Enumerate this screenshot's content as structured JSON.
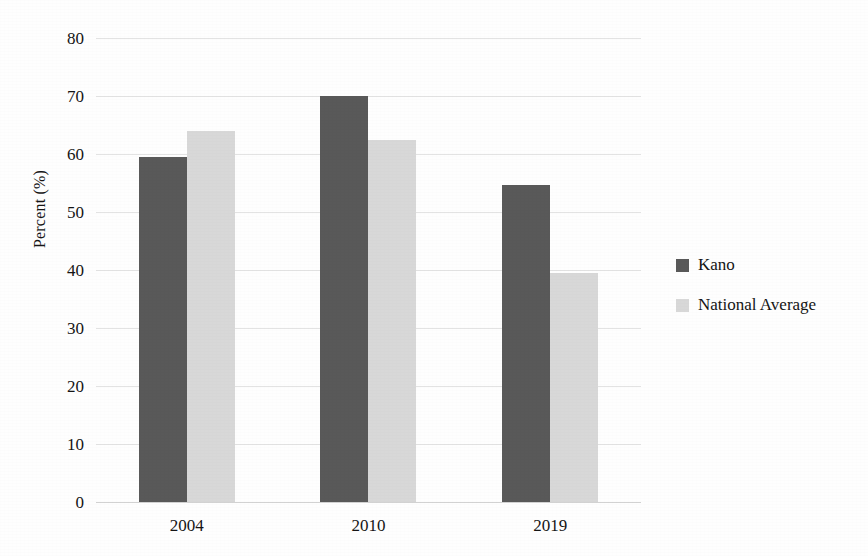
{
  "chart_data": {
    "type": "bar",
    "title": "",
    "subtitle": "",
    "xlabel": "",
    "ylabel": "Percent (%)",
    "categories": [
      "2004",
      "2010",
      "2019"
    ],
    "series": [
      {
        "name": "Kano",
        "color": "#595959",
        "values": [
          59.5,
          70.0,
          54.7
        ]
      },
      {
        "name": "National Average",
        "color": "#d8d8d8",
        "values": [
          64.0,
          62.4,
          39.5
        ]
      }
    ],
    "ylim": [
      0,
      80
    ],
    "ytick_step": 10,
    "yticks": [
      "80",
      "70",
      "60",
      "50",
      "40",
      "30",
      "20",
      "10",
      "0"
    ],
    "grid": true,
    "legend_position": "right"
  },
  "axes": {
    "y_title": "Percent (%)",
    "y_ticks": [
      {
        "label": "80",
        "value": 80
      },
      {
        "label": "70",
        "value": 70
      },
      {
        "label": "60",
        "value": 60
      },
      {
        "label": "50",
        "value": 50
      },
      {
        "label": "40",
        "value": 40
      },
      {
        "label": "30",
        "value": 30
      },
      {
        "label": "20",
        "value": 20
      },
      {
        "label": "10",
        "value": 10
      },
      {
        "label": "0",
        "value": 0
      }
    ],
    "x_ticks": [
      {
        "label": "2004"
      },
      {
        "label": "2010"
      },
      {
        "label": "2019"
      }
    ]
  },
  "legend": {
    "items": [
      {
        "label": "Kano",
        "color": "#595959"
      },
      {
        "label": "National Average",
        "color": "#d8d8d8"
      }
    ]
  },
  "colors": {
    "kano": "#595959",
    "national_average": "#d8d8d8",
    "gridline": "#e3e3e3",
    "text": "#151515",
    "background": "#fefefe"
  }
}
